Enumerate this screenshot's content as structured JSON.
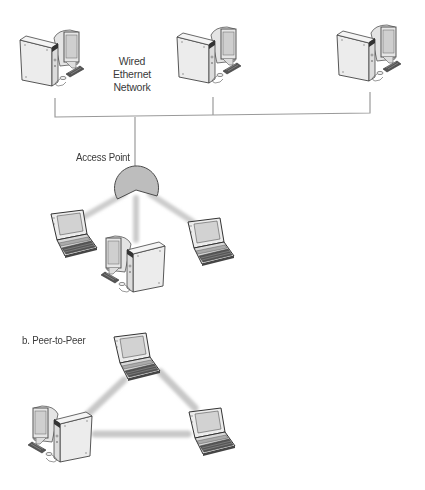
{
  "diagram": {
    "section_a": {
      "wired_label": [
        "Wired",
        "Ethernet",
        "Network"
      ],
      "access_point_label": "Access Point",
      "wired_nodes": [
        "desktop-1",
        "desktop-2",
        "desktop-3"
      ],
      "wireless_nodes": [
        "laptop-left",
        "desktop-center",
        "laptop-right"
      ]
    },
    "section_b": {
      "title": "b. Peer-to-Peer",
      "nodes": [
        "laptop-top",
        "desktop-bottom-left",
        "laptop-right"
      ],
      "links": [
        [
          "laptop-top",
          "desktop-bottom-left"
        ],
        [
          "laptop-top",
          "laptop-right"
        ],
        [
          "desktop-bottom-left",
          "laptop-right"
        ]
      ]
    },
    "colors": {
      "line": "#9a9a9a",
      "wireless_beam": "#cfcfcf",
      "access_point_fill": "#bdbdbd",
      "device_outline": "#444444",
      "device_fill": "#e9e9e9",
      "screen_fill": "#d6d6d6",
      "text": "#3a3a3a"
    }
  }
}
